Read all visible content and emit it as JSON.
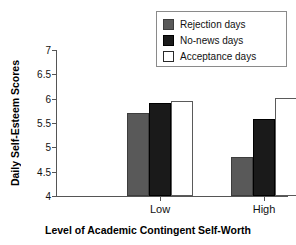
{
  "chart_data": {
    "type": "bar",
    "title": "",
    "xlabel": "Level of Academic Contingent Self-Worth",
    "ylabel": "Daily Self-Esteem Scores",
    "categories": [
      "Low",
      "High"
    ],
    "series": [
      {
        "name": "Rejection days",
        "values": [
          5.7,
          4.8
        ],
        "color": "#595959",
        "swatch": "gray"
      },
      {
        "name": "No-news days",
        "values": [
          5.92,
          5.58
        ],
        "color": "#1a1a1a",
        "swatch": "black"
      },
      {
        "name": "Acceptance days",
        "values": [
          5.96,
          6.02
        ],
        "color": "#ffffff",
        "swatch": "white"
      }
    ],
    "ylim": [
      4,
      7
    ],
    "ytick_labels": [
      "7",
      "6.5",
      "6",
      "5.5",
      "5",
      "4.5",
      "4"
    ],
    "ytick_values": [
      7,
      6.5,
      6,
      5.5,
      5,
      4.5,
      4
    ],
    "grid": false,
    "legend_position": "top-right"
  },
  "legend": {
    "items": [
      {
        "label": "Rejection days"
      },
      {
        "label": "No-news days"
      },
      {
        "label": "Acceptance days"
      }
    ]
  }
}
